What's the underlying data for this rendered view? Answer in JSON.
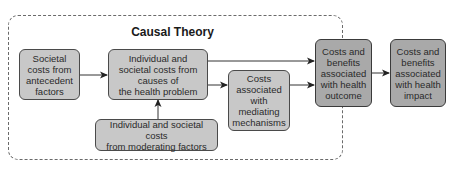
{
  "diagram": {
    "frame_title": "Causal Theory",
    "nodes": {
      "antecedent": {
        "label": "Societal\ncosts from\nantecedent\nfactors"
      },
      "causes": {
        "label": "Individual and\nsocietal costs from\ncauses of\nthe health problem"
      },
      "mediating": {
        "label": "Costs\nassociated\nwith\nmediating\nmechanisms"
      },
      "moderating": {
        "label": "Individual and societal costs\nfrom moderating factors"
      },
      "outcome": {
        "label": "Costs and\nbenefits\nassociated\nwith health\noutcome"
      },
      "impact": {
        "label": "Costs and\nbenefits\nassociated\nwith health\nimpact"
      }
    },
    "edges": [
      {
        "from": "antecedent",
        "to": "causes"
      },
      {
        "from": "causes",
        "to": "mediating"
      },
      {
        "from": "causes",
        "to": "outcome"
      },
      {
        "from": "mediating",
        "to": "outcome"
      },
      {
        "from": "moderating",
        "to": "causes"
      },
      {
        "from": "outcome",
        "to": "impact"
      }
    ],
    "colors": {
      "inner_box_fill": "#c8c8c8",
      "outcome_box_fill": "#a9a9a9",
      "border": "#4a4a4a",
      "frame_dash": "#6a6a6a"
    }
  }
}
